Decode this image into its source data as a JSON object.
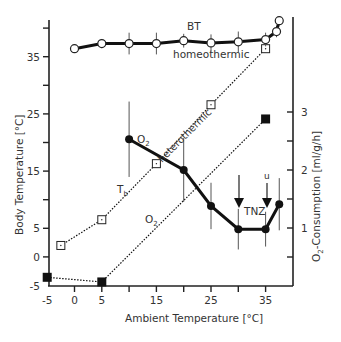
{
  "chart_data": {
    "type": "line",
    "title": "",
    "xlabel": "Ambient Temperature [°C]",
    "ylabel_left": "Body Temperature [°C]",
    "ylabel_right": "O2-Consumption [ml/g/h]",
    "x_ticks": [
      -5,
      0,
      5,
      15,
      25,
      35
    ],
    "x_minor_ticks": [
      10,
      20,
      30
    ],
    "y_left_ticks": [
      -5,
      0,
      5,
      15,
      25,
      35
    ],
    "y_left_minor_ticks": [
      10,
      20,
      30,
      40
    ],
    "y_right_ticks": [
      1,
      2,
      3
    ],
    "y_right_minor_ticks": [
      0.5,
      1.5,
      2.5
    ],
    "xlim": [
      -5,
      38
    ],
    "ylim_left": [
      -5,
      40
    ],
    "ylim_right": [
      0,
      4
    ],
    "grid": false,
    "series": [
      {
        "name": "BT (homeothermic)",
        "axis": "left",
        "style": "solid-thick",
        "marker": "open-circle",
        "x": [
          0,
          5,
          10,
          15,
          20,
          25,
          30,
          35,
          37,
          37.5
        ],
        "y": [
          36.4,
          37.3,
          37.3,
          37.3,
          37.8,
          37.4,
          37.6,
          38.0,
          39.4,
          41.3
        ],
        "error": [
          0,
          0.8,
          1.9,
          1.9,
          1.2,
          1.5,
          1.8,
          1.2,
          1.0,
          0
        ]
      },
      {
        "name": "Tb (heterothermic)",
        "axis": "left",
        "style": "dotted",
        "marker": "open-square",
        "x": [
          -2.5,
          5,
          15,
          25,
          35
        ],
        "y": [
          2.0,
          6.5,
          16.3,
          26.6,
          36.4
        ]
      },
      {
        "name": "O2 (homeothermic)",
        "axis": "right",
        "style": "solid-thick",
        "marker": "filled-circle",
        "x": [
          10,
          20,
          25,
          30,
          35,
          37.5
        ],
        "y": [
          2.53,
          2.0,
          1.38,
          0.98,
          0.98,
          1.41
        ],
        "error": [
          0.65,
          0.55,
          0.4,
          0.35,
          0.3,
          0.45
        ]
      },
      {
        "name": "O2 (heterothermic)",
        "axis": "right",
        "style": "dotted",
        "marker": "filled-square",
        "x": [
          -5,
          5,
          35
        ],
        "y": [
          0.15,
          0.07,
          2.88
        ]
      }
    ],
    "annotations": [
      {
        "text": "BT",
        "x": 20,
        "y_left": 40
      },
      {
        "text": "homeothermic",
        "x": 23,
        "y_left": 34
      },
      {
        "text": "heterothermic",
        "x": 18,
        "y_left": 22,
        "rotated": true
      },
      {
        "text": "O2",
        "x": 12,
        "y_right": 2.6
      },
      {
        "text": "Tb",
        "x": 8,
        "y_left": 11
      },
      {
        "text": "O2",
        "x": 15,
        "y_right": 0.8
      },
      {
        "text": "TNZ",
        "x": 31.5,
        "y_right": 1.25
      },
      {
        "text": "l",
        "x": 30,
        "arrow": "down",
        "meaning": "lower critical temperature"
      },
      {
        "text": "u",
        "x": 35,
        "arrow": "down",
        "meaning": "upper critical temperature"
      }
    ]
  },
  "labels": {
    "xlabel": "Ambient Temperature [°C]",
    "ylabel_left": "Body Temperature [°C]",
    "ylabel_right_main": "O",
    "ylabel_right_sub": "2",
    "ylabel_right_rest": "-Consumption [ml/g/h]",
    "bt": "BT",
    "homeothermic": "homeothermic",
    "heterothermic": "heterothermic",
    "o2_main": "O",
    "o2_sub": "2",
    "tb_main": "T",
    "tb_sub": "b",
    "tnz": "TNZ",
    "arrow_l": "l",
    "arrow_u": "u"
  }
}
